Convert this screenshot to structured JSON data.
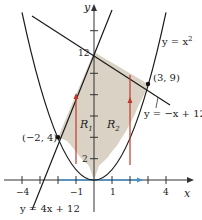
{
  "figure": {
    "type": "region-between-curves",
    "curves": [
      {
        "id": "parabola",
        "equation": "y = x^2",
        "label": "y = x",
        "label_sup": "2"
      },
      {
        "id": "line_decreasing",
        "equation": "y = -x + 12",
        "label": "y = −x + 12"
      },
      {
        "id": "line_increasing",
        "equation": "y = 4x + 12",
        "label": "y = 4x + 12"
      }
    ],
    "points": [
      {
        "x": 3,
        "y": 9,
        "label": "(3, 9)"
      },
      {
        "x": -2,
        "y": 4,
        "label": "(−2, 4)"
      }
    ],
    "regions": [
      {
        "id": "R1",
        "label": "R",
        "sub": "1"
      },
      {
        "id": "R2",
        "label": "R",
        "sub": "2"
      }
    ],
    "axes": {
      "x_label": "x",
      "y_label": "y",
      "x_ticks": [
        "−4",
        "−1",
        "1",
        "4"
      ],
      "y_ticks": [
        "2",
        "12"
      ]
    },
    "colors": {
      "curve": "#1a1a1a",
      "region_fill": "#d9d2c5",
      "arrow_red": "#c0392b",
      "arrow_blue": "#4a90c8"
    }
  }
}
